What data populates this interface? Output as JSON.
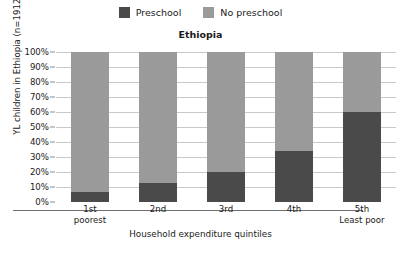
{
  "legend": {
    "items": [
      {
        "label": "Preschool",
        "color": "#4a4a4a",
        "icon": "legend-square-icon"
      },
      {
        "label": "No preschool",
        "color": "#9a9a9a",
        "icon": "legend-square-icon"
      }
    ]
  },
  "chart_data": {
    "type": "bar",
    "subtype": "stacked-percentage-column",
    "title": "Ethiopia",
    "xlabel": "Household expenditure quintiles",
    "ylabel": "YL children in Ethiopia (n=1912)",
    "categories": [
      "1st",
      "2nd",
      "3rd",
      "4th",
      "5th"
    ],
    "category_sublabels": [
      "poorest",
      "",
      "",
      "",
      "Least poor"
    ],
    "series": [
      {
        "name": "Preschool",
        "color": "#4a4a4a",
        "values": [
          7,
          13,
          20,
          34,
          60
        ]
      },
      {
        "name": "No preschool",
        "color": "#9a9a9a",
        "values": [
          93,
          87,
          80,
          66,
          40
        ]
      }
    ],
    "ylim": [
      0,
      100
    ],
    "yticks": [
      0,
      10,
      20,
      30,
      40,
      50,
      60,
      70,
      80,
      90,
      100
    ],
    "ytick_labels": [
      "0%",
      "10%",
      "20%",
      "30%",
      "40%",
      "50%",
      "60%",
      "70%",
      "80%",
      "90%",
      "100%"
    ],
    "grid": true,
    "legend_position": "top-center"
  },
  "marks": {
    "top_left": "",
    "bottom_right": ""
  }
}
